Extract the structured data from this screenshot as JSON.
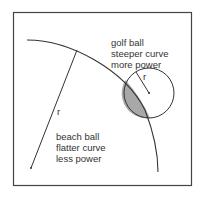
{
  "diagram": {
    "golf_ball": {
      "lines": [
        "golf ball",
        "steeper curve",
        "more power"
      ],
      "radius_label": "r"
    },
    "beach_ball": {
      "lines": [
        "beach ball",
        "flatter curve",
        "less power"
      ],
      "radius_label": "r"
    },
    "colors": {
      "stroke": "#333333",
      "frame": "#444444",
      "overlap_fill": "#a8a8a8",
      "background": "#ffffff"
    }
  }
}
